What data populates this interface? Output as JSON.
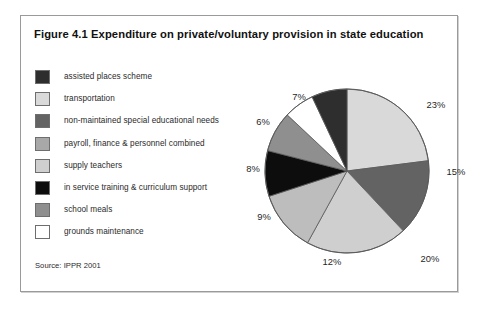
{
  "figure": {
    "title": "Figure 4.1 Expenditure on private/voluntary provision in state education",
    "source": "Source: IPPR 2001"
  },
  "legend": {
    "items": [
      {
        "label": "assisted places scheme",
        "color": "#2e2e2e"
      },
      {
        "label": "transportation",
        "color": "#d9d9d9"
      },
      {
        "label": "non-maintained special educational needs",
        "color": "#636363"
      },
      {
        "label": "payroll, finance & personnel combined",
        "color": "#a8a8a8"
      },
      {
        "label": "supply teachers",
        "color": "#cfcfcf"
      },
      {
        "label": "in service training & curriculum support",
        "color": "#0d0d0d"
      },
      {
        "label": "school meals",
        "color": "#8f8f8f"
      },
      {
        "label": "grounds maintenance",
        "color": "#ffffff"
      }
    ]
  },
  "chart_data": {
    "type": "pie",
    "title": "Figure 4.1 Expenditure on private/voluntary provision in state education",
    "xlabel": "",
    "ylabel": "",
    "units": "percent",
    "start_angle_deg": 0,
    "direction": "clockwise",
    "legend_position": "left",
    "grid": false,
    "total": 100,
    "categories": [
      "transportation",
      "non-maintained special educational needs",
      "supply teachers",
      "payroll, finance & personnel combined",
      "in service training & curriculum support",
      "school meals",
      "grounds maintenance",
      "assisted places scheme"
    ],
    "values": [
      23,
      15,
      20,
      12,
      9,
      8,
      6,
      7
    ],
    "colors": [
      "#d9d9d9",
      "#636363",
      "#cfcfcf",
      "#bdbdbd",
      "#0d0d0d",
      "#8f8f8f",
      "#ffffff",
      "#2e2e2e"
    ],
    "labels": [
      "23%",
      "15%",
      "20%",
      "12%",
      "9%",
      "8%",
      "6%",
      "7%"
    ],
    "label_positions": [
      {
        "text": "23%",
        "x": 199,
        "y": 43
      },
      {
        "text": "15%",
        "x": 219,
        "y": 110
      },
      {
        "text": "20%",
        "x": 193,
        "y": 197
      },
      {
        "text": "12%",
        "x": 95,
        "y": 200
      },
      {
        "text": "9%",
        "x": 27,
        "y": 155
      },
      {
        "text": "8%",
        "x": 16,
        "y": 107
      },
      {
        "text": "6%",
        "x": 26,
        "y": 60
      },
      {
        "text": "7%",
        "x": 62,
        "y": 35
      }
    ]
  }
}
